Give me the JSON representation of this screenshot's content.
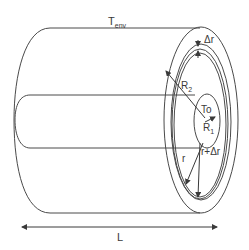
{
  "diagram": {
    "labels": {
      "t_env": "T",
      "t_env_sub": "env",
      "delta_r": "Δr",
      "r2": "R",
      "r2_sub": "2",
      "to": "To",
      "r1": "R",
      "r1_sub": "1",
      "r": "r",
      "r_plus_dr": "r+Δr",
      "length": "L"
    },
    "colors": {
      "stroke": "#4a4a4a",
      "text": "#3a3a3a",
      "background": "#ffffff"
    }
  }
}
